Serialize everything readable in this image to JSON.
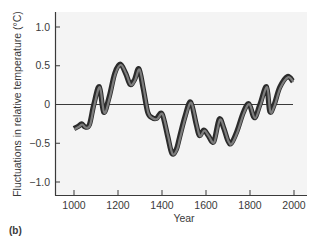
{
  "chart_data": {
    "type": "line",
    "title": "",
    "panel_label": "(b)",
    "xlabel": "Year",
    "ylabel": "Fluctuations in relative temperature (°C)",
    "xlim": [
      930,
      2030
    ],
    "ylim": [
      -1.17,
      1.17
    ],
    "x_ticks": [
      1000,
      1200,
      1400,
      1600,
      1800,
      2000
    ],
    "x_tick_labels": [
      "1000",
      "1200",
      "1400",
      "1600",
      "1800",
      "2000"
    ],
    "y_ticks": [
      1.0,
      0.5,
      0,
      -0.5,
      -1.0
    ],
    "y_tick_labels": [
      "1.0",
      "0.5",
      "0",
      "-0.5",
      "-1.0"
    ],
    "grid": false,
    "reference_line": 0,
    "legend": null,
    "series": [
      {
        "name": "Relative temperature fluctuation (band)",
        "x": [
          1000,
          1020,
          1035,
          1050,
          1070,
          1090,
          1115,
          1135,
          1160,
          1185,
          1210,
          1235,
          1255,
          1275,
          1295,
          1315,
          1335,
          1355,
          1375,
          1400,
          1425,
          1445,
          1465,
          1480,
          1505,
          1530,
          1555,
          1570,
          1590,
          1610,
          1635,
          1660,
          1680,
          1700,
          1715,
          1740,
          1770,
          1795,
          1820,
          1845,
          1875,
          1890,
          1910,
          1935,
          1970,
          1995
        ],
        "values": [
          -0.31,
          -0.28,
          -0.25,
          -0.29,
          -0.26,
          0.0,
          0.23,
          -0.1,
          0.1,
          0.4,
          0.52,
          0.4,
          0.26,
          0.32,
          0.46,
          0.2,
          -0.1,
          -0.17,
          -0.18,
          -0.12,
          -0.4,
          -0.63,
          -0.58,
          -0.42,
          -0.15,
          0.03,
          -0.25,
          -0.4,
          -0.33,
          -0.4,
          -0.48,
          -0.19,
          -0.3,
          -0.47,
          -0.5,
          -0.35,
          -0.1,
          0.01,
          -0.17,
          0.0,
          0.23,
          -0.09,
          0.0,
          0.22,
          0.36,
          0.3
        ]
      }
    ],
    "colors": {
      "line": "#2b2b2b",
      "band_fill": "#7d7d7d",
      "plot_background": "#f4f4f4",
      "axis": "#3a3a3a"
    }
  }
}
